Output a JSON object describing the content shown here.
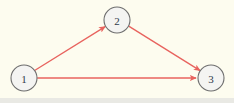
{
  "diagram": {
    "background_color": "#fdfcef",
    "bottom_strip_color": "#e9e9e4",
    "edge_color": "#e8635e",
    "node_fill_color": "#f4f4f2",
    "node_stroke_color": "#6e6e6e",
    "node_label_color": "#2f3a4a",
    "nodes": [
      {
        "id": "1",
        "label": "1",
        "cx": 24,
        "cy": 78,
        "r": 13
      },
      {
        "id": "2",
        "label": "2",
        "cx": 117,
        "cy": 20,
        "r": 13
      },
      {
        "id": "3",
        "label": "3",
        "cx": 211,
        "cy": 78,
        "r": 13
      }
    ],
    "edges": [
      {
        "id": "edge-1-2",
        "from": "1",
        "to": "2",
        "directed": true
      },
      {
        "id": "edge-2-3",
        "from": "2",
        "to": "3",
        "directed": true
      },
      {
        "id": "edge-1-3",
        "from": "1",
        "to": "3",
        "directed": true
      }
    ]
  }
}
